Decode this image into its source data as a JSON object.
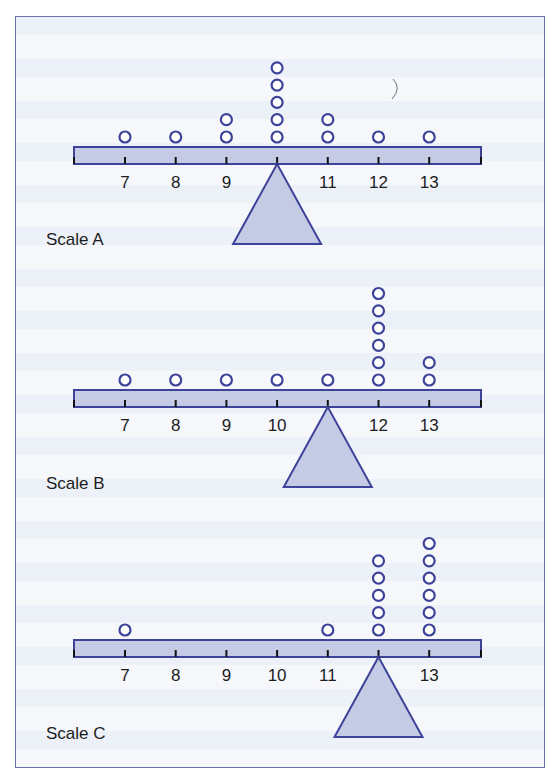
{
  "figure": {
    "colors": {
      "stroke": "#3d4399",
      "fill": "#c6cbe5",
      "tick": "#111111",
      "text": "#1d1d1d"
    },
    "axis_ticks": [
      7,
      8,
      9,
      10,
      11,
      12,
      13
    ],
    "scales": [
      {
        "label": "Scale A",
        "counts": {
          "7": 1,
          "8": 1,
          "9": 2,
          "10": 5,
          "11": 2,
          "12": 1,
          "13": 1
        },
        "fulcrum_at": 10
      },
      {
        "label": "Scale B",
        "counts": {
          "7": 1,
          "8": 1,
          "9": 1,
          "10": 1,
          "11": 1,
          "12": 6,
          "13": 2
        },
        "fulcrum_at": 11
      },
      {
        "label": "Scale C",
        "counts": {
          "7": 1,
          "8": 0,
          "9": 0,
          "10": 0,
          "11": 1,
          "12": 5,
          "13": 6
        },
        "fulcrum_at": 12
      }
    ]
  },
  "chart_data": [
    {
      "type": "scatter",
      "title": "Scale A",
      "x": [
        7,
        8,
        9,
        10,
        11,
        12,
        13
      ],
      "values": [
        1,
        1,
        2,
        5,
        2,
        1,
        1
      ],
      "fulcrum": 10,
      "xlabel": "",
      "ylabel": "count (dot plot)"
    },
    {
      "type": "scatter",
      "title": "Scale B",
      "x": [
        7,
        8,
        9,
        10,
        11,
        12,
        13
      ],
      "values": [
        1,
        1,
        1,
        1,
        1,
        6,
        2
      ],
      "fulcrum": 11,
      "xlabel": "",
      "ylabel": "count (dot plot)"
    },
    {
      "type": "scatter",
      "title": "Scale C",
      "x": [
        7,
        8,
        9,
        10,
        11,
        12,
        13
      ],
      "values": [
        1,
        0,
        0,
        0,
        1,
        5,
        6
      ],
      "fulcrum": 12,
      "xlabel": "",
      "ylabel": "count (dot plot)"
    }
  ]
}
